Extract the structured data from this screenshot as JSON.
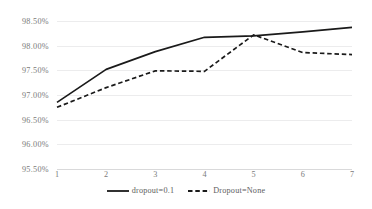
{
  "chart_data": {
    "type": "line",
    "title": "",
    "xlabel": "",
    "ylabel": "",
    "x": [
      1,
      2,
      3,
      4,
      5,
      6,
      7
    ],
    "xtick_labels": [
      "1",
      "2",
      "3",
      "4",
      "5",
      "6",
      "7"
    ],
    "ytick_labels": [
      "98.50%",
      "98.00%",
      "97.50%",
      "97.00%",
      "96.50%",
      "96.00%",
      "95.50%"
    ],
    "ytick_values": [
      98.5,
      98.0,
      97.5,
      97.0,
      96.5,
      96.0,
      95.5
    ],
    "ylim": [
      95.5,
      98.5
    ],
    "xlim": [
      1,
      7
    ],
    "grid": "horizontal",
    "legend_position": "bottom-center",
    "series": [
      {
        "name": "dropout=0.1",
        "style": "solid",
        "color": "#1a1a1a",
        "values": [
          96.85,
          97.52,
          97.88,
          98.17,
          98.2,
          98.28,
          98.37
        ]
      },
      {
        "name": "Dropout=None",
        "style": "dashed",
        "color": "#1a1a1a",
        "values": [
          96.75,
          97.15,
          97.49,
          97.48,
          98.22,
          97.86,
          97.82
        ]
      }
    ]
  },
  "legend": {
    "items": [
      {
        "label": "dropout=0.1",
        "style": "solid"
      },
      {
        "label": "Dropout=None",
        "style": "dashed"
      }
    ]
  },
  "colors": {
    "background": "#ffffff",
    "gridline": "#ececed",
    "axis": "#d9d9da",
    "tick_text": "#7b7b7b",
    "legend_text": "#5e5e5e",
    "series_line": "#1a1a1a"
  }
}
